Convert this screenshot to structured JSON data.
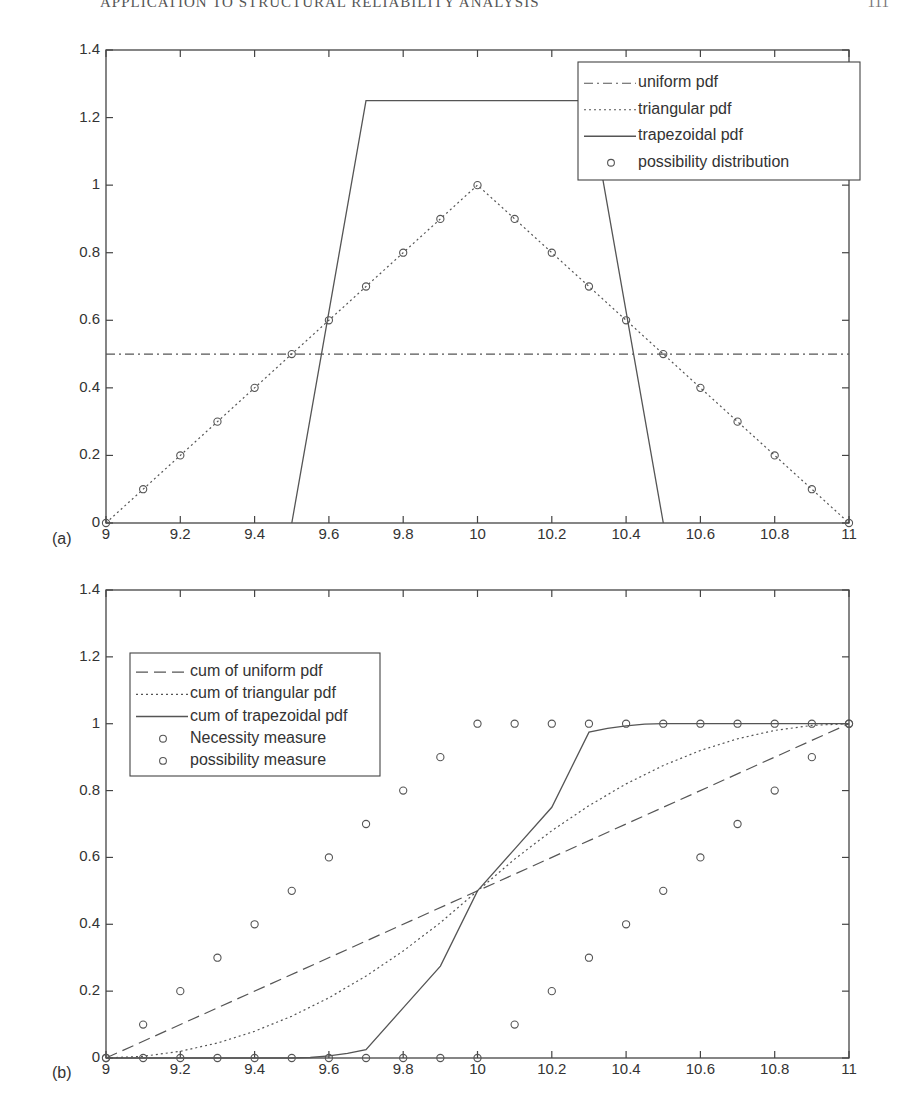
{
  "page": {
    "running_head": "APPLICATION TO STRUCTURAL RELIABILITY ANALYSIS",
    "page_number": "111"
  },
  "chart_data": [
    {
      "panel": "(a)",
      "type": "line",
      "title": "",
      "xlabel": "",
      "ylabel": "",
      "xlim": [
        9,
        11
      ],
      "ylim": [
        0,
        1.4
      ],
      "xticks": [
        "9",
        "9.2",
        "9.4",
        "9.6",
        "9.8",
        "10",
        "10.2",
        "10.4",
        "10.6",
        "10.8",
        "11"
      ],
      "yticks": [
        "0",
        "0.2",
        "0.4",
        "0.6",
        "0.8",
        "1",
        "1.2",
        "1.4"
      ],
      "grid": false,
      "legend_position": "upper right",
      "series": [
        {
          "name": "uniform pdf",
          "style": "dash-dot",
          "x": [
            9,
            11
          ],
          "y": [
            0.5,
            0.5
          ]
        },
        {
          "name": "triangular pdf",
          "style": "dotted",
          "x": [
            9,
            10,
            11
          ],
          "y": [
            0,
            1,
            0
          ]
        },
        {
          "name": "trapezoidal pdf",
          "style": "solid",
          "x": [
            9.5,
            9.7,
            10.3,
            10.5
          ],
          "y": [
            0,
            1.25,
            1.25,
            0
          ]
        },
        {
          "name": "possibility distribution",
          "style": "circle-markers",
          "x": [
            9,
            9.1,
            9.2,
            9.3,
            9.4,
            9.5,
            9.6,
            9.7,
            9.8,
            9.9,
            10,
            10.1,
            10.2,
            10.3,
            10.4,
            10.5,
            10.6,
            10.7,
            10.8,
            10.9,
            11
          ],
          "y": [
            0,
            0.1,
            0.2,
            0.3,
            0.4,
            0.5,
            0.6,
            0.7,
            0.8,
            0.9,
            1,
            0.9,
            0.8,
            0.7,
            0.6,
            0.5,
            0.4,
            0.3,
            0.2,
            0.1,
            0
          ]
        }
      ]
    },
    {
      "panel": "(b)",
      "type": "line",
      "title": "",
      "xlabel": "",
      "ylabel": "",
      "xlim": [
        9,
        11
      ],
      "ylim": [
        0,
        1.4
      ],
      "xticks": [
        "9",
        "9.2",
        "9.4",
        "9.6",
        "9.8",
        "10",
        "10.2",
        "10.4",
        "10.6",
        "10.8",
        "11"
      ],
      "yticks": [
        "0",
        "0.2",
        "0.4",
        "0.6",
        "0.8",
        "1",
        "1.2",
        "1.4"
      ],
      "grid": false,
      "legend_position": "upper left",
      "series": [
        {
          "name": "cum of uniform pdf",
          "style": "dashed",
          "x": [
            9,
            11
          ],
          "y": [
            0,
            1
          ]
        },
        {
          "name": "cum of triangular pdf",
          "style": "dotted",
          "x": [
            9,
            9.1,
            9.2,
            9.3,
            9.4,
            9.5,
            9.6,
            9.7,
            9.8,
            9.9,
            10,
            10.1,
            10.2,
            10.3,
            10.4,
            10.5,
            10.6,
            10.7,
            10.8,
            10.9,
            11
          ],
          "y": [
            0,
            0.005,
            0.02,
            0.045,
            0.08,
            0.125,
            0.18,
            0.245,
            0.32,
            0.405,
            0.5,
            0.595,
            0.68,
            0.755,
            0.82,
            0.875,
            0.92,
            0.955,
            0.98,
            0.995,
            1
          ]
        },
        {
          "name": "cum of trapezoidal pdf",
          "style": "solid",
          "x": [
            9,
            9.5,
            9.55,
            9.6,
            9.65,
            9.7,
            9.8,
            9.9,
            10,
            10.1,
            10.2,
            10.3,
            10.35,
            10.4,
            10.45,
            10.5,
            11
          ],
          "y": [
            0,
            0,
            0.0016,
            0.0063,
            0.0141,
            0.025,
            0.15,
            0.275,
            0.5,
            0.625,
            0.75,
            0.975,
            0.9859,
            0.9937,
            0.9984,
            1,
            1
          ]
        },
        {
          "name": "Necessity measure",
          "style": "circle-markers",
          "x": [
            9,
            9.1,
            9.2,
            9.3,
            9.4,
            9.5,
            9.6,
            9.7,
            9.8,
            9.9,
            10,
            10.1,
            10.2,
            10.3,
            10.4,
            10.5,
            10.6,
            10.7,
            10.8,
            10.9,
            11
          ],
          "y": [
            0,
            0,
            0,
            0,
            0,
            0,
            0,
            0,
            0,
            0,
            0,
            0.1,
            0.2,
            0.3,
            0.4,
            0.5,
            0.6,
            0.7,
            0.8,
            0.9,
            1
          ]
        },
        {
          "name": "possibility measure",
          "style": "circle-markers",
          "x": [
            9,
            9.1,
            9.2,
            9.3,
            9.4,
            9.5,
            9.6,
            9.7,
            9.8,
            9.9,
            10,
            10.1,
            10.2,
            10.3,
            10.4,
            10.5,
            10.6,
            10.7,
            10.8,
            10.9,
            11
          ],
          "y": [
            0,
            0.1,
            0.2,
            0.3,
            0.4,
            0.5,
            0.6,
            0.7,
            0.8,
            0.9,
            1,
            1,
            1,
            1,
            1,
            1,
            1,
            1,
            1,
            1,
            1
          ]
        }
      ]
    }
  ]
}
